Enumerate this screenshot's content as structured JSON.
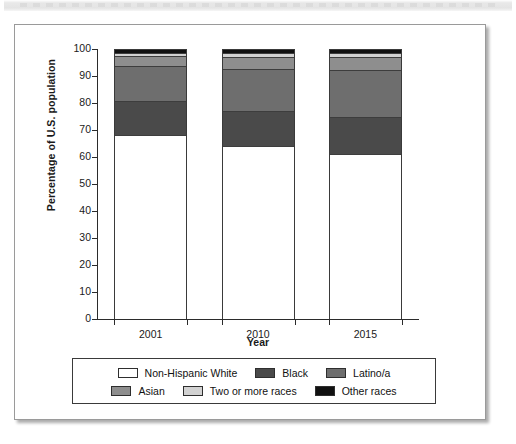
{
  "figure": {
    "top_strip_note": ""
  },
  "chart_data": {
    "type": "bar",
    "subtype": "stacked-100",
    "title": "",
    "xlabel": "Year",
    "ylabel": "Percentage of U.S. population",
    "ylim": [
      0,
      100
    ],
    "yticks": [
      100,
      90,
      80,
      70,
      60,
      50,
      40,
      30,
      20,
      10,
      0
    ],
    "categories": [
      "2001",
      "2010",
      "2015"
    ],
    "grid": false,
    "legend_position": "bottom",
    "series": [
      {
        "name": "Non-Hispanic White",
        "color": "#ffffff",
        "values": [
          68.5,
          64.5,
          61.5
        ]
      },
      {
        "name": "Black",
        "color": "#4a4a4a",
        "values": [
          12.5,
          13.0,
          13.5
        ]
      },
      {
        "name": "Latino/a",
        "color": "#6e6e6e",
        "values": [
          13.0,
          15.5,
          17.5
        ]
      },
      {
        "name": "Asian",
        "color": "#8e8e8e",
        "values": [
          3.8,
          4.5,
          5.0
        ]
      },
      {
        "name": "Two or more races",
        "color": "#d2d2d2",
        "values": [
          1.2,
          1.5,
          1.5
        ]
      },
      {
        "name": "Other races",
        "color": "#111111",
        "values": [
          1.0,
          1.0,
          1.0
        ]
      }
    ]
  },
  "legend": {
    "items": [
      {
        "label": "Non-Hispanic White",
        "color": "#ffffff"
      },
      {
        "label": "Black",
        "color": "#4a4a4a"
      },
      {
        "label": "Latino/a",
        "color": "#6e6e6e"
      },
      {
        "label": "Asian",
        "color": "#8e8e8e"
      },
      {
        "label": "Two or more races",
        "color": "#d2d2d2"
      },
      {
        "label": "Other races",
        "color": "#111111"
      }
    ]
  }
}
